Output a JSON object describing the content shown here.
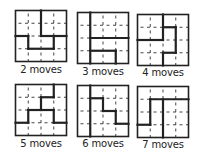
{
  "figure": {
    "grid_size": 4,
    "colors": {
      "border": "#222222",
      "wall": "#222222",
      "dashed": "#444444",
      "background": "#ffffff"
    },
    "puzzles": [
      {
        "label": "2 moves",
        "x": 15,
        "y": 10,
        "size": 51,
        "label_x": 11,
        "label_y": 64,
        "walls": [
          [
            2,
            0,
            2,
            2
          ],
          [
            2,
            2,
            4,
            2
          ],
          [
            0,
            2,
            1,
            2
          ],
          [
            1,
            2,
            1,
            3
          ],
          [
            1,
            3,
            3,
            3
          ],
          [
            3,
            2,
            3,
            3
          ]
        ]
      },
      {
        "label": "3 moves",
        "x": 77,
        "y": 12,
        "size": 51,
        "label_x": 73,
        "label_y": 66,
        "walls": [
          [
            1,
            0,
            1,
            4
          ],
          [
            1,
            2,
            4,
            2
          ],
          [
            1,
            3,
            3,
            3
          ],
          [
            3,
            3,
            3,
            4
          ]
        ]
      },
      {
        "label": "4 moves",
        "x": 137,
        "y": 14,
        "size": 51,
        "label_x": 133,
        "label_y": 67,
        "walls": [
          [
            2,
            0,
            2,
            2
          ],
          [
            0,
            2,
            2,
            2
          ],
          [
            2,
            1,
            3,
            1
          ],
          [
            3,
            1,
            3,
            3
          ],
          [
            2,
            3,
            3,
            3
          ],
          [
            2,
            3,
            2,
            4
          ]
        ]
      },
      {
        "label": "5 moves",
        "x": 15,
        "y": 84,
        "size": 51,
        "label_x": 11,
        "label_y": 138,
        "walls": [
          [
            3,
            0,
            3,
            1
          ],
          [
            2,
            1,
            3,
            1
          ],
          [
            2,
            1,
            2,
            2
          ],
          [
            1,
            2,
            3,
            2
          ],
          [
            3,
            2,
            3,
            3
          ],
          [
            3,
            3,
            4,
            3
          ],
          [
            1,
            2,
            1,
            3
          ],
          [
            0,
            3,
            1,
            3
          ]
        ]
      },
      {
        "label": "6 moves",
        "x": 77,
        "y": 85,
        "size": 51,
        "label_x": 73,
        "label_y": 138,
        "walls": [
          [
            1,
            0,
            1,
            4
          ],
          [
            1,
            1,
            2,
            1
          ],
          [
            2,
            1,
            2,
            2
          ],
          [
            2,
            2,
            3,
            2
          ],
          [
            3,
            2,
            3,
            3
          ],
          [
            3,
            3,
            4,
            3
          ]
        ]
      },
      {
        "label": "7 moves",
        "x": 137,
        "y": 86,
        "size": 51,
        "label_x": 133,
        "label_y": 139,
        "walls": [
          [
            1,
            1,
            4,
            1
          ],
          [
            1,
            1,
            1,
            3
          ],
          [
            0,
            3,
            1,
            3
          ],
          [
            2,
            1,
            2,
            4
          ]
        ]
      }
    ]
  }
}
